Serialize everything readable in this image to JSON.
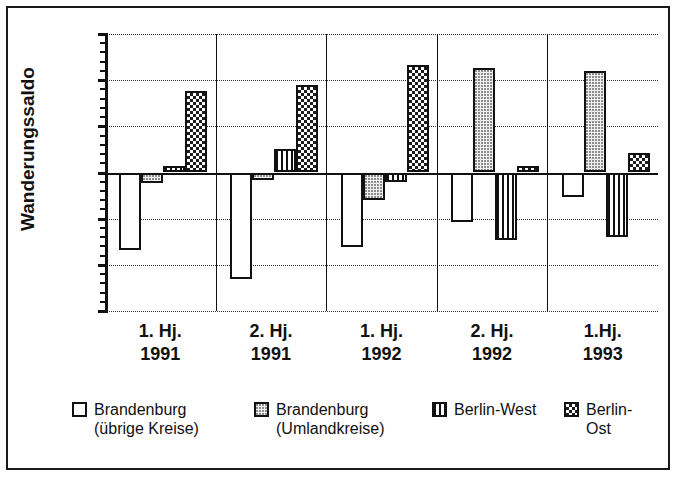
{
  "chart_data": {
    "type": "bar",
    "title": "",
    "xlabel": "",
    "ylabel": "Wanderungssaldo",
    "ylim": [
      -1500,
      1500
    ],
    "ytick_labels": [
      "1500",
      "1000",
      "500",
      "0",
      "-500",
      "-1000",
      "-1500"
    ],
    "ytick_values": [
      1500,
      1000,
      500,
      0,
      -500,
      -1000,
      -1500
    ],
    "grid": true,
    "legend_position": "bottom",
    "categories": [
      "1. Hj.\n1991",
      "2. Hj.\n1991",
      "1. Hj.\n1992",
      "2. Hj.\n1992",
      "1.Hj.\n1993"
    ],
    "category_lines": [
      [
        "1. Hj.",
        "1991"
      ],
      [
        "2. Hj.",
        "1991"
      ],
      [
        "1. Hj.",
        "1992"
      ],
      [
        "2. Hj.",
        "1992"
      ],
      [
        "1.Hj.",
        "1993"
      ]
    ],
    "series": [
      {
        "name": "Brandenburg\n(übrige Kreise)",
        "name_lines": [
          "Brandenburg",
          "(übrige Kreise)"
        ],
        "fill": "white",
        "values": [
          -840,
          -1150,
          -810,
          -540,
          -260
        ]
      },
      {
        "name": "Brandenburg\n(Umlandkreise)",
        "name_lines": [
          "Brandenburg",
          "(Umlandkreise)"
        ],
        "fill": "dots",
        "values": [
          -110,
          -80,
          -300,
          1130,
          1100
        ]
      },
      {
        "name": "Berlin-West",
        "name_lines": [
          "Berlin-West"
        ],
        "fill": "vlines",
        "values": [
          70,
          250,
          -100,
          -730,
          -700
        ]
      },
      {
        "name": "Berlin-Ost",
        "name_lines": [
          "Berlin-Ost"
        ],
        "fill": "checker",
        "values": [
          880,
          950,
          1160,
          70,
          210
        ]
      }
    ]
  },
  "colors": {
    "axis": "#111111",
    "background": "#ffffff",
    "grid": "#333333"
  }
}
